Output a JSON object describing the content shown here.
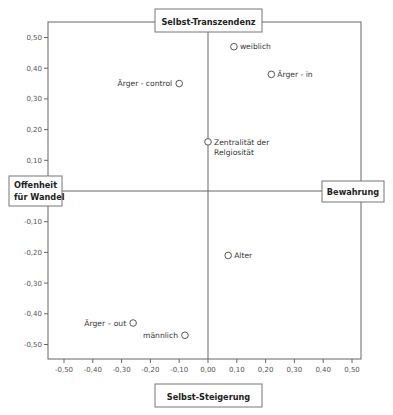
{
  "chart_data": {
    "type": "scatter",
    "title": "",
    "xlabel": "",
    "ylabel": "",
    "xlim": [
      -0.55,
      0.55
    ],
    "ylim": [
      -0.55,
      0.55
    ],
    "grid": false,
    "x_ticks": [
      -0.5,
      -0.4,
      -0.3,
      -0.2,
      -0.1,
      0.0,
      0.1,
      0.2,
      0.3,
      0.4,
      0.5
    ],
    "x_tick_labels": [
      "-0,50",
      "-0,40",
      "-0,30",
      "-0,20",
      "-0,10",
      "0,00",
      "0,10",
      "0,20",
      "0,30",
      "0,40",
      "0,50"
    ],
    "y_ticks": [
      0.5,
      0.4,
      0.3,
      0.2,
      0.1,
      -0.1,
      -0.2,
      -0.3,
      -0.4,
      -0.5
    ],
    "y_tick_labels": [
      "0,50",
      "0,40",
      "0,30",
      "0,20",
      "0,10",
      "-0,10",
      "-0,20",
      "-0,30",
      "-0,40",
      "-0,50"
    ],
    "pole_labels": {
      "top": "Selbst-Transzendenz",
      "bottom": "Selbst-Steigerung",
      "left_line1": "Offenheit",
      "left_line2": "für Wandel",
      "right": "Bewahrung"
    },
    "points": [
      {
        "label": "weiblich",
        "x": 0.09,
        "y": 0.47,
        "label_side": "right"
      },
      {
        "label": "Ärger - in",
        "x": 0.22,
        "y": 0.38,
        "label_side": "right"
      },
      {
        "label": "Ärger - control",
        "x": -0.1,
        "y": 0.35,
        "label_side": "left"
      },
      {
        "label": "Zentralität der",
        "label2": "Relgiosität",
        "x": 0.0,
        "y": 0.16,
        "label_side": "right"
      },
      {
        "label": "Alter",
        "x": 0.07,
        "y": -0.21,
        "label_side": "right"
      },
      {
        "label": "Ärger – out",
        "x": -0.26,
        "y": -0.43,
        "label_side": "left"
      },
      {
        "label": "männlich",
        "x": -0.08,
        "y": -0.47,
        "label_side": "left"
      }
    ]
  }
}
